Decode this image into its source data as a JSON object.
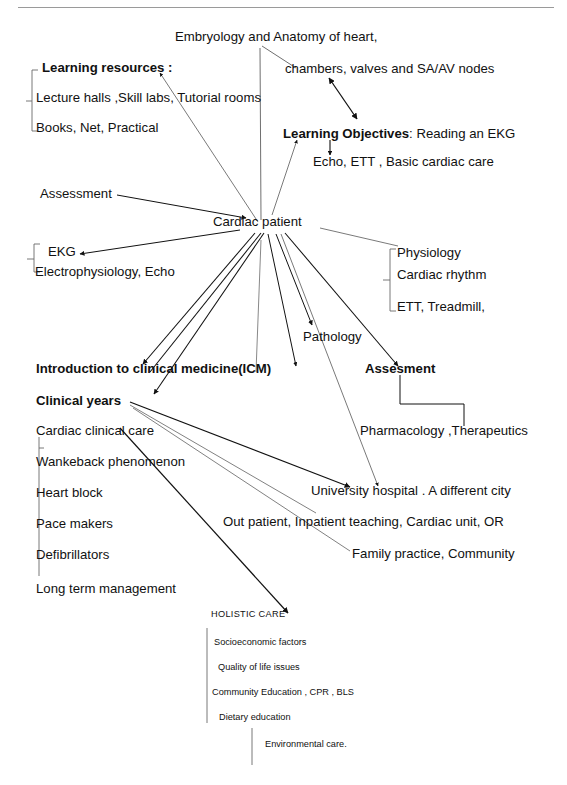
{
  "page": {
    "background_color": "#ffffff",
    "ink_color": "#111111",
    "rule_color": "#9a9a9a"
  },
  "center": {
    "label": "Cardiac  patient"
  },
  "nodes": {
    "embryology": "Embryology and Anatomy of heart,",
    "chambers": "chambers, valves and SA/AV nodes",
    "learning_resources_heading": "Learning resources :",
    "lecture_halls": "Lecture halls ,Skill labs, Tutorial rooms",
    "books_net": "Books, Net, Practical",
    "learning_objectives_bold": "Learning Objectives",
    "learning_objectives_rest": ": Reading an EKG",
    "echo_ett": "Echo, ETT ,  Basic cardiac care",
    "assessment_left": "Assessment",
    "ekg": "EKG",
    "electrophysiology": "Electrophysiology,  Echo",
    "physiology": "Physiology",
    "cardiac_rhythm": "Cardiac rhythm",
    "ett_treadmill": "ETT, Treadmill,",
    "pathology": "Pathology",
    "icm": "Introduction to clinical medicine(ICM)",
    "assesment_right": "Assesment",
    "pharmacology": "Pharmacology ,Therapeutics",
    "clinical_years": "Clinical years",
    "cardiac_clinical_care": "Cardiac  clinical care",
    "wankeback": "Wankeback phenomenon",
    "heart_block": "Heart block",
    "pace_makers": "Pace makers",
    "defibrillators": "Defibrillators",
    "long_term": "Long term management",
    "university_hospital": "University hospital  . A  different city",
    "out_patient": "Out patient, Inpatient teaching, Cardiac unit, OR",
    "family_practice": "Family practice, Community",
    "holistic_care": "HOLISTIC  CARE",
    "socioeconomic": "Socioeconomic factors",
    "quality_of_life": "Quality of life issues",
    "community_education": "Community Education ,   CPR , BLS",
    "dietary_education": "Dietary education",
    "environmental_care": "Environmental care."
  }
}
